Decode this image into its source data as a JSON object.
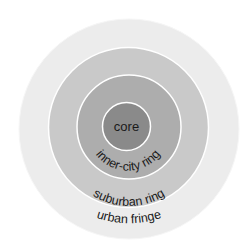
{
  "diagram": {
    "type": "concentric-rings",
    "zones": [
      {
        "id": "urban-fringe",
        "label": "urban fringe",
        "color": "#ececec"
      },
      {
        "id": "suburban-ring",
        "label": "suburban ring",
        "color": "#c9c9c9"
      },
      {
        "id": "inner-city-ring",
        "label": "inner-city ring",
        "color": "#adadad"
      },
      {
        "id": "core",
        "label": "core",
        "color": "#8a8a8a"
      }
    ],
    "ring_border_color": "#ffffff"
  }
}
